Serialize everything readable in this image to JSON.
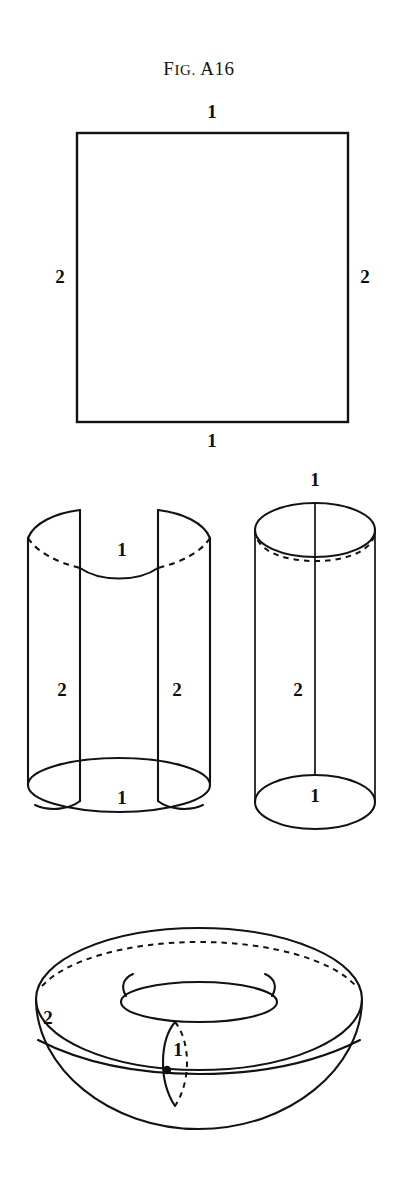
{
  "figure": {
    "caption_lead": "F",
    "caption_rest": "IG.",
    "caption_full": "Fig. A16",
    "caption_number": "A16",
    "ink_color": "#121212",
    "background_color": "#ffffff"
  },
  "panels": {
    "square": {
      "name": "square-identification-diagram",
      "labels": {
        "top": "1",
        "bottom": "1",
        "left": "2",
        "right": "2"
      }
    },
    "open_cylinder": {
      "name": "partially-rolled-cylinder",
      "labels": {
        "top_arc": "1",
        "left_seam": "2",
        "right_seam": "2",
        "bottom_arc": "1"
      }
    },
    "closed_cylinder": {
      "name": "closed-cylinder",
      "labels": {
        "top": "1",
        "seam": "2",
        "bottom": "1"
      }
    },
    "torus": {
      "name": "torus",
      "labels": {
        "outer_edge": "2",
        "meridian": "1"
      }
    }
  }
}
